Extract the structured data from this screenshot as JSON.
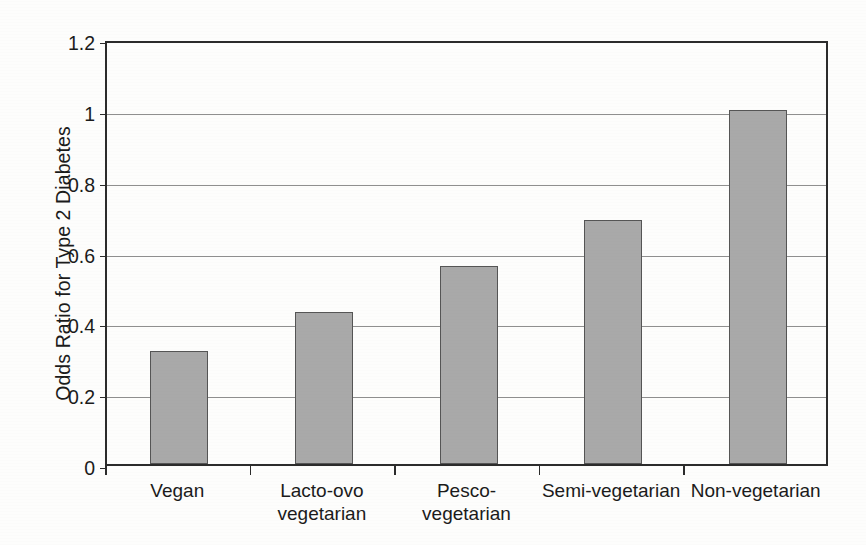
{
  "chart_data": {
    "type": "bar",
    "title": "",
    "xlabel": "",
    "ylabel": "Odds Ratio for Type 2 Diabetes",
    "ylim": [
      0,
      1.2
    ],
    "ytick_labels": [
      "0",
      "0.2",
      "0.4",
      "0.6",
      "0.8",
      "1",
      "1.2"
    ],
    "ytick_values": [
      0,
      0.2,
      0.4,
      0.6,
      0.8,
      1,
      1.2
    ],
    "grid": true,
    "legend": "none",
    "bar_color": "#a9a9a9",
    "bar_edge_color": "#555555",
    "categories": [
      "Vegan",
      "Lacto-ovo\nvegetarian",
      "Pesco-vegetarian",
      "Semi-vegetarian",
      "Non-vegetarian"
    ],
    "values": [
      0.32,
      0.43,
      0.56,
      0.69,
      1.0
    ]
  }
}
